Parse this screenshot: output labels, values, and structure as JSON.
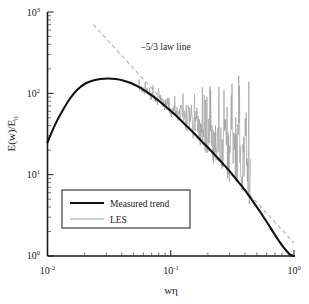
{
  "chart_data": {
    "type": "line",
    "title": "",
    "xlabel": "wη",
    "ylabel": "E(w)/E₀",
    "xscale": "log",
    "yscale": "log",
    "xlim": [
      0.01,
      1.0
    ],
    "ylim": [
      1,
      1000
    ],
    "xticks": [
      "10⁻²",
      "10⁻¹",
      "10⁰"
    ],
    "xtick_values": [
      0.01,
      0.1,
      1.0
    ],
    "yticks": [
      "10⁰",
      "10¹",
      "10²",
      "10³"
    ],
    "ytick_values": [
      1,
      10,
      100,
      1000
    ],
    "grid": false,
    "legend_position": "lower-left",
    "annotations": [
      {
        "text": "–5/3 law line",
        "x": 0.075,
        "y": 420
      }
    ],
    "series": [
      {
        "name": "Measured trend",
        "style": "solid",
        "color": "#111111",
        "width": 2.1,
        "x": [
          0.01,
          0.0115,
          0.0133,
          0.0153,
          0.0176,
          0.0203,
          0.0234,
          0.0269,
          0.031,
          0.0357,
          0.0411,
          0.0474,
          0.0546,
          0.0629,
          0.0724,
          0.0834,
          0.0961,
          0.1107,
          0.1275,
          0.1468,
          0.1691,
          0.1948,
          0.2244,
          0.2585,
          0.2977,
          0.3429,
          0.395,
          0.455,
          0.5241,
          0.6037,
          0.6954,
          0.801,
          0.9226,
          1.0
        ],
        "y": [
          25,
          41,
          62,
          87,
          112,
          132,
          144,
          150,
          152,
          150,
          144,
          134,
          121,
          106,
          91,
          77,
          64,
          53,
          43,
          35,
          28,
          22.5,
          18,
          14.2,
          11.2,
          8.6,
          6.6,
          4.9,
          3.6,
          2.6,
          1.85,
          1.35,
          1.05,
          1.0
        ]
      },
      {
        "name": "LES",
        "style": "noisy",
        "color": "#9a9a9a",
        "width": 0.65,
        "x_range": [
          0.055,
          0.45
        ],
        "note": "noisy spiky signal oscillating about the measured trend, amplitude growing toward high wavenumber",
        "x": [
          0.055,
          0.0575,
          0.0601,
          0.0628,
          0.0657,
          0.0687,
          0.0718,
          0.0751,
          0.0785,
          0.0821,
          0.0858,
          0.0897,
          0.0938,
          0.098,
          0.1025,
          0.1072,
          0.112,
          0.1171,
          0.1225,
          0.128,
          0.1339,
          0.14,
          0.1463,
          0.153,
          0.16,
          0.1673,
          0.1749,
          0.1829,
          0.1912,
          0.1999,
          0.209,
          0.2185,
          0.2285,
          0.2389,
          0.2497,
          0.2611,
          0.273,
          0.2854,
          0.2984,
          0.312,
          0.3262,
          0.341,
          0.3566,
          0.3728,
          0.3898,
          0.4075,
          0.4261,
          0.4455
        ],
        "y": [
          120,
          113,
          108,
          104,
          96,
          90,
          97,
          84,
          79,
          86,
          73,
          68,
          74,
          63,
          59,
          66,
          54,
          50,
          57,
          46,
          43,
          51,
          39,
          36,
          44,
          33,
          30,
          38,
          28,
          25,
          34,
          23,
          21,
          30,
          19,
          17.5,
          27,
          16,
          14.5,
          25,
          13.5,
          12.5,
          23,
          11.8,
          11,
          21,
          10.4,
          9.8
        ]
      },
      {
        "name": "–5/3 law line",
        "style": "dashed",
        "color": "#b0b0b0",
        "width": 1.1,
        "slope": -1.6667,
        "x": [
          0.0235,
          1.0
        ],
        "y": [
          700,
          1.45
        ]
      }
    ],
    "legend": [
      {
        "label": "Measured trend",
        "style": "solid",
        "color": "#111111"
      },
      {
        "label": "LES",
        "style": "solid",
        "color": "#9a9a9a"
      }
    ]
  },
  "axes": {
    "x_label_base": "wη",
    "y_label_text": "E(w)/E",
    "y_label_sub": "0",
    "x_tick_labels": [
      {
        "mantissa": "10",
        "exponent": "-2"
      },
      {
        "mantissa": "10",
        "exponent": "-1"
      },
      {
        "mantissa": "10",
        "exponent": "0"
      }
    ],
    "y_tick_labels": [
      {
        "mantissa": "10",
        "exponent": "3"
      },
      {
        "mantissa": "10",
        "exponent": "2"
      },
      {
        "mantissa": "10",
        "exponent": "1"
      },
      {
        "mantissa": "10",
        "exponent": "0"
      }
    ]
  },
  "annotation": {
    "law_line_text": "–5/3 law line"
  },
  "legend": {
    "measured_label": "Measured trend",
    "les_label": "LES"
  },
  "colors": {
    "trend": "#111111",
    "les": "#9a9a9a",
    "law": "#b0b0b0",
    "axis": "#1a1a1a"
  }
}
